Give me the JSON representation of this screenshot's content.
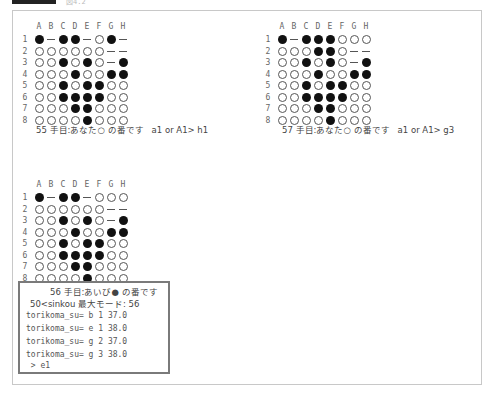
{
  "header": {
    "tag_label": "",
    "caption": "図4.2"
  },
  "legend": {
    "black": "●",
    "white": "○",
    "empty": "—"
  },
  "columns": [
    "A",
    "B",
    "C",
    "D",
    "E",
    "F",
    "G",
    "H"
  ],
  "rows": [
    "1",
    "2",
    "3",
    "4",
    "5",
    "6",
    "7",
    "8"
  ],
  "boards": [
    {
      "id": "board-55",
      "cells": [
        [
          "B",
          "-",
          "B",
          "B",
          "-",
          "W",
          "B",
          "-"
        ],
        [
          "W",
          "W",
          "W",
          "W",
          "W",
          "W",
          "-",
          "-"
        ],
        [
          "W",
          "W",
          "B",
          "W",
          "B",
          "W",
          "-",
          "B"
        ],
        [
          "W",
          "W",
          "W",
          "B",
          "W",
          "W",
          "B",
          "B"
        ],
        [
          "W",
          "W",
          "B",
          "W",
          "B",
          "B",
          "W",
          "W"
        ],
        [
          "W",
          "W",
          "B",
          "B",
          "B",
          "B",
          "W",
          "W"
        ],
        [
          "W",
          "W",
          "W",
          "B",
          "B",
          "W",
          "W",
          "W"
        ],
        [
          "W",
          "W",
          "W",
          "W",
          "B",
          "W",
          "W",
          "W"
        ]
      ],
      "status": "55 手目:あなた○ の番です   a1 or A1> h1"
    },
    {
      "id": "board-57",
      "cells": [
        [
          "B",
          "-",
          "B",
          "B",
          "B",
          "W",
          "W",
          "W"
        ],
        [
          "W",
          "W",
          "W",
          "B",
          "B",
          "W",
          "-",
          "-"
        ],
        [
          "W",
          "W",
          "B",
          "W",
          "B",
          "W",
          "-",
          "B"
        ],
        [
          "W",
          "W",
          "W",
          "B",
          "W",
          "W",
          "B",
          "B"
        ],
        [
          "W",
          "W",
          "B",
          "W",
          "B",
          "B",
          "W",
          "W"
        ],
        [
          "W",
          "W",
          "B",
          "B",
          "B",
          "B",
          "W",
          "W"
        ],
        [
          "W",
          "W",
          "W",
          "B",
          "B",
          "W",
          "W",
          "W"
        ],
        [
          "W",
          "W",
          "W",
          "W",
          "B",
          "W",
          "W",
          "W"
        ]
      ],
      "status": "57 手目:あなた○ の番です   a1 or A1> g3"
    },
    {
      "id": "board-56",
      "cells": [
        [
          "B",
          "-",
          "B",
          "B",
          "-",
          "W",
          "W",
          "W"
        ],
        [
          "W",
          "W",
          "W",
          "W",
          "W",
          "W",
          "-",
          "-"
        ],
        [
          "W",
          "W",
          "B",
          "W",
          "B",
          "W",
          "-",
          "B"
        ],
        [
          "W",
          "W",
          "W",
          "B",
          "W",
          "W",
          "B",
          "B"
        ],
        [
          "W",
          "W",
          "B",
          "W",
          "B",
          "B",
          "W",
          "W"
        ],
        [
          "W",
          "W",
          "B",
          "B",
          "B",
          "B",
          "W",
          "W"
        ],
        [
          "W",
          "W",
          "W",
          "B",
          "B",
          "W",
          "W",
          "W"
        ],
        [
          "W",
          "W",
          "W",
          "W",
          "B",
          "W",
          "W",
          "W"
        ]
      ]
    }
  ],
  "ai_panel": {
    "turn": "56 手目:あいび● の番です",
    "mode": "50<sinkou 最大モード: 56",
    "candidates": [
      "torikoma_su= b 1 37.0",
      "torikoma_su= e 1 38.0",
      "torikoma_su= g 2 37.0",
      "torikoma_su= g 3 38.0"
    ],
    "prompt": " > e1"
  }
}
